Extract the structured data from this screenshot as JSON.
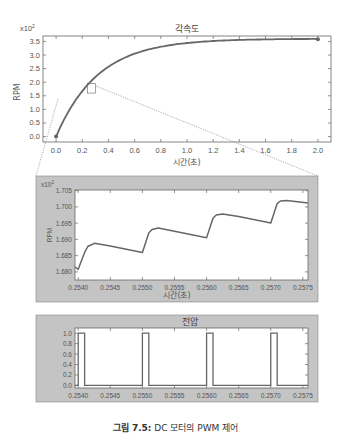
{
  "chart_data": [
    {
      "type": "line",
      "title": "각속도",
      "xlabel": "시간(초)",
      "ylabel": "RPM",
      "y_multiplier": "x10^2",
      "xlim": [
        -0.1,
        2.1
      ],
      "ylim": [
        -0.2,
        3.7
      ],
      "x_ticks": [
        "0.0",
        "0.2",
        "0.4",
        "0.6",
        "0.8",
        "1.0",
        "1.2",
        "1.4",
        "1.6",
        "1.8",
        "2.0"
      ],
      "y_ticks": [
        "0.0",
        "0.5",
        "1.0",
        "1.5",
        "2.0",
        "2.5",
        "3.0",
        "3.5"
      ],
      "series": [
        {
          "name": "angular velocity",
          "x": [
            0.0,
            0.1,
            0.2,
            0.3,
            0.4,
            0.6,
            0.8,
            1.0,
            1.2,
            1.4,
            1.6,
            1.8,
            2.0
          ],
          "values": [
            0.0,
            0.9,
            1.55,
            2.0,
            2.35,
            2.85,
            3.15,
            3.33,
            3.43,
            3.5,
            3.54,
            3.56,
            3.58
          ]
        }
      ],
      "markers": [
        {
          "x": 0.0,
          "y": 0.0
        },
        {
          "x": 2.0,
          "y": 3.58
        }
      ],
      "zoom_box": {
        "x": [
          0.24,
          0.3
        ],
        "y": [
          1.6,
          1.95
        ]
      },
      "grid": false
    },
    {
      "type": "line",
      "title": "",
      "xlabel": "시간(초)",
      "ylabel": "RPM",
      "y_multiplier": "x10^2",
      "xlim": [
        0.25395,
        0.25758
      ],
      "ylim": [
        1.6775,
        1.7052
      ],
      "x_ticks": [
        "0.2540",
        "0.2545",
        "0.2550",
        "0.2555",
        "0.2560",
        "0.2565",
        "0.2570",
        "0.2575"
      ],
      "y_ticks": [
        "1.680",
        "1.685",
        "1.690",
        "1.695",
        "1.700",
        "1.705"
      ],
      "series": [
        {
          "name": "angular velocity (zoomed)",
          "x": [
            0.25395,
            0.254,
            0.2541,
            0.25415,
            0.25425,
            0.2545,
            0.255,
            0.2551,
            0.25515,
            0.25525,
            0.2555,
            0.256,
            0.2561,
            0.25615,
            0.25625,
            0.2565,
            0.257,
            0.2571,
            0.25715,
            0.25725,
            0.25758
          ],
          "values": [
            1.6815,
            1.6808,
            1.686,
            1.6878,
            1.6888,
            1.688,
            1.686,
            1.692,
            1.693,
            1.6935,
            1.6925,
            1.6905,
            1.6965,
            1.6975,
            1.6978,
            1.697,
            1.695,
            1.701,
            1.7018,
            1.702,
            1.7012
          ]
        }
      ],
      "grid": false
    },
    {
      "type": "line",
      "title": "전압",
      "xlabel": "",
      "ylabel": "",
      "xlim": [
        0.25395,
        0.25758
      ],
      "ylim": [
        -0.05,
        1.1
      ],
      "x_ticks": [
        "0.2540",
        "0.2545",
        "0.2550",
        "0.2555",
        "0.2560",
        "0.2565",
        "0.2570",
        "0.2575"
      ],
      "y_ticks": [
        "0.0",
        "0.2",
        "0.4",
        "0.6",
        "0.8",
        "1.0"
      ],
      "series": [
        {
          "name": "PWM voltage",
          "pulses": [
            {
              "start": 0.254,
              "end": 0.2541
            },
            {
              "start": 0.255,
              "end": 0.2551
            },
            {
              "start": 0.256,
              "end": 0.2561
            },
            {
              "start": 0.257,
              "end": 0.2571
            }
          ],
          "high": 1.0,
          "low": 0.0
        }
      ],
      "grid": false
    }
  ],
  "figure": {
    "caption_label": "그림 7.5:",
    "caption_text": " DC 모터의 PWM 제어"
  },
  "plot1": {
    "title": "각속도",
    "xlabel": "시간(초)",
    "ylabel": "RPM",
    "multiplier_base": "x10",
    "multiplier_exp": "2"
  },
  "plot2": {
    "xlabel": "시간(초)",
    "ylabel": "RPM",
    "multiplier_base": "x10",
    "multiplier_exp": "2"
  },
  "plot3": {
    "title": "전압"
  },
  "colors": {
    "line": "#666666",
    "panel_bg": "#c4c4c4",
    "axis": "#555555"
  }
}
